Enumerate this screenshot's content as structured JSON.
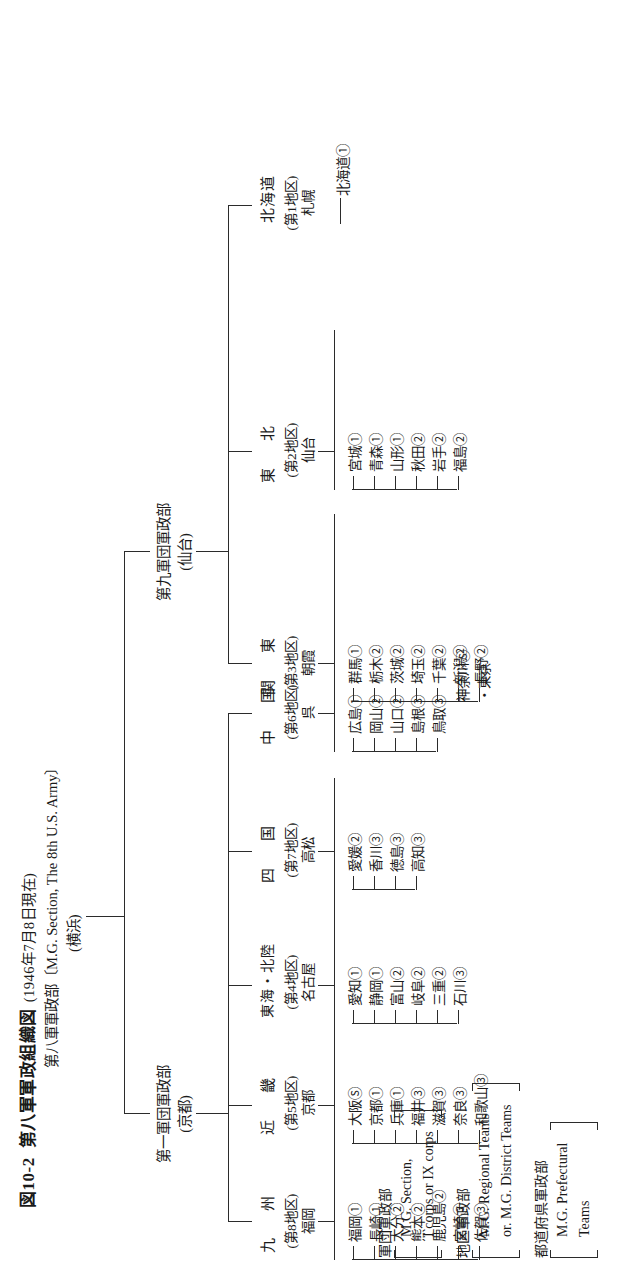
{
  "figure": {
    "number": "図10-2",
    "title": "第八軍軍政組織図",
    "date": "(1946年7月8日現在)",
    "root": "第八軍軍政部〔M.G. Section, The 8th U.S. Army〕",
    "root_location": "(横浜)"
  },
  "corps": [
    {
      "name": "第九軍団軍政部",
      "location": "(仙台)"
    },
    {
      "name": "第一軍団軍政部",
      "location": "(京都)"
    }
  ],
  "regions": [
    {
      "name": "北海道",
      "district": "(第1地区)",
      "district_city": "札幌",
      "prefectures": [
        "北海道①"
      ]
    },
    {
      "name": "東　北",
      "district": "(第2地区)",
      "district_city": "仙台",
      "prefectures": [
        "宮城①",
        "青森①",
        "山形①",
        "秋田②",
        "岩手②",
        "福島②"
      ]
    },
    {
      "name": "関　東",
      "district": "(第3地区)",
      "district_city": "朝霞",
      "prefectures": [
        "群馬①",
        "栃木②",
        "茨城②",
        "埼玉②",
        "千葉②",
        "新潟②",
        "長野②"
      ],
      "extra": [
        "神奈川Ⓢ",
        "・東京"
      ]
    },
    {
      "name": "中　国",
      "district": "(第6地区)",
      "district_city": "呉",
      "prefectures": [
        "広島①",
        "岡山②",
        "山口②",
        "島根③",
        "鳥取③"
      ]
    },
    {
      "name": "四　国",
      "district": "(第7地区)",
      "district_city": "高松",
      "prefectures": [
        "愛媛②",
        "香川③",
        "徳島③",
        "高知③"
      ]
    },
    {
      "name": "東海・北陸",
      "district": "(第4地区)",
      "district_city": "名古屋",
      "prefectures": [
        "愛知①",
        "静岡①",
        "富山②",
        "岐阜②",
        "三重②",
        "石川③"
      ]
    },
    {
      "name": "近　畿",
      "district": "(第5地区)",
      "district_city": "京都",
      "prefectures": [
        "大阪Ⓢ",
        "京都①",
        "兵庫①",
        "福井③",
        "滋賀③",
        "奈良③",
        "和歌山③"
      ]
    },
    {
      "name": "九　州",
      "district": "(第8地区)",
      "district_city": "福岡",
      "prefectures": [
        "福岡①",
        "長崎①",
        "大分②",
        "熊本②",
        "鹿児島②",
        "宮崎③",
        "佐賀③"
      ]
    }
  ],
  "legend": [
    {
      "jp": "軍団軍政部",
      "en": [
        "M.G. Section,",
        "I corps or IX corps"
      ]
    },
    {
      "jp": "地区軍政部",
      "en": [
        "M.G. Regional Teams",
        "or. M.G. District Teams"
      ]
    },
    {
      "jp": "都道府県軍政部",
      "en": [
        "M.G. Prefectural",
        "Teams"
      ]
    }
  ],
  "colors": {
    "ink": "#1a1a1a",
    "line": "#2b2b2b",
    "paper": "#ffffff"
  }
}
